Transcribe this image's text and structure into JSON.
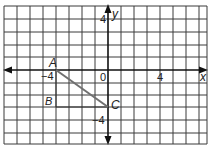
{
  "figure": {
    "type": "coordinate-grid",
    "x_axis_label": "x",
    "y_axis_label": "y",
    "origin_label": "0",
    "tick_labels": {
      "x_positive": "4",
      "x_negative": "−4",
      "y_positive": "4",
      "y_negative": "−4"
    },
    "x_range": [
      -8,
      7
    ],
    "y_range": [
      -5,
      5
    ],
    "grid_unit": 1,
    "points": [
      {
        "name": "A",
        "label": "A",
        "x": -4,
        "y": 0
      },
      {
        "name": "B",
        "label": "B",
        "x": -4,
        "y": -3
      },
      {
        "name": "C",
        "label": "C",
        "x": 0,
        "y": -3
      }
    ],
    "segments": [
      {
        "from": "A",
        "to": "C",
        "style": "thick-gray"
      },
      {
        "from": "A",
        "to": "B",
        "style": "thin"
      },
      {
        "from": "B",
        "to": "C",
        "style": "thin"
      }
    ],
    "colors": {
      "grid": "#3a3a3a",
      "axis": "#111111",
      "segment": "#707070",
      "background": "#ffffff"
    }
  }
}
